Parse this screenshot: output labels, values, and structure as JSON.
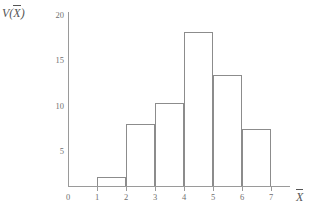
{
  "chart_data": {
    "type": "bar",
    "title": "",
    "subtitle": "",
    "xlabel": "X̄",
    "ylabel": "V(X̄)",
    "xlabel_base": "V(",
    "grid": false,
    "legend": false,
    "bin_edges": [
      1,
      2,
      3,
      4,
      5,
      6,
      7
    ],
    "categories": [
      "1-2",
      "2-3",
      "3-4",
      "4-5",
      "5-6",
      "6-7"
    ],
    "values": [
      1.0,
      6.8,
      9.2,
      17.0,
      12.2,
      6.3
    ],
    "xlim": [
      0,
      7.6
    ],
    "ylim": [
      0,
      20
    ],
    "x_ticks": [
      "0",
      "1",
      "2",
      "3",
      "4",
      "5",
      "6",
      "7"
    ],
    "x_tick_values": [
      0,
      1,
      2,
      3,
      4,
      5,
      6,
      7
    ],
    "y_ticks": [
      "5",
      "10",
      "15",
      "20"
    ],
    "y_tick_values": [
      5,
      10,
      15,
      20
    ]
  },
  "axes": {
    "y_title_prefix": "V(",
    "y_title_var": "X",
    "y_title_suffix": ")",
    "x_title_var": "X"
  },
  "ticks": {
    "y": [
      {
        "label": "20",
        "top": 11
      },
      {
        "label": "15",
        "top": 56
      },
      {
        "label": "10",
        "top": 102
      },
      {
        "label": "5",
        "top": 147
      }
    ],
    "y_zero": {
      "label": "0",
      "top": 192,
      "left": 63
    },
    "x": [
      {
        "label": "0",
        "left": 68
      },
      {
        "label": "1",
        "left": 97
      },
      {
        "label": "2",
        "left": 126
      },
      {
        "label": "3",
        "left": 155
      },
      {
        "label": "4",
        "left": 184
      },
      {
        "label": "5",
        "left": 213
      },
      {
        "label": "6",
        "left": 242
      },
      {
        "label": "7",
        "left": 271
      }
    ]
  },
  "bars": [
    {
      "name": "bar-1-2",
      "left": 97,
      "width": 29,
      "top": 183,
      "height": 3
    },
    {
      "name": "bar-2-3",
      "left": 126,
      "width": 29,
      "top": 143,
      "height": 43
    },
    {
      "name": "bar-3-4",
      "left": 155,
      "width": 29,
      "top": 118,
      "height": 68
    },
    {
      "name": "bar-4-5",
      "left": 184,
      "width": 29,
      "top": 46,
      "height": 140
    },
    {
      "name": "bar-5-6",
      "left": 213,
      "width": 29,
      "top": 89,
      "height": 97
    },
    {
      "name": "bar-6-7",
      "left": 242,
      "width": 29,
      "top": 146,
      "height": 40
    }
  ],
  "colors": {
    "bar_stroke": "#8c8c8c",
    "axis": "#9a9a9a",
    "text": "#6f6f6f",
    "background": "#ffffff"
  }
}
